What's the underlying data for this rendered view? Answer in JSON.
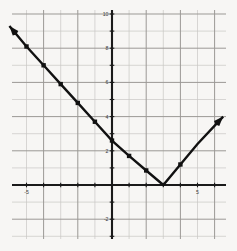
{
  "chart_data": {
    "type": "line",
    "title": "",
    "xlabel": "",
    "ylabel": "",
    "xlim": [
      -6.5,
      6.8
    ],
    "ylim": [
      -4.2,
      10.5
    ],
    "grid": true,
    "minor_grid_step": 1,
    "major_grid_step": 2,
    "legend": "none",
    "axis_color": "#1a1a1a",
    "grid_color_minor": "#c9c7c4",
    "grid_color_major": "#9a9894",
    "curve_color": "#111111",
    "background_color": "#f7f6f4",
    "x_tick_labels": [
      {
        "value": -5,
        "text": "-5"
      },
      {
        "value": 5,
        "text": "5"
      }
    ],
    "y_tick_labels": [
      {
        "value": 10,
        "text": "10"
      },
      {
        "value": 8,
        "text": "8"
      },
      {
        "value": 6,
        "text": "6"
      },
      {
        "value": 4,
        "text": "4"
      },
      {
        "value": 2,
        "text": "2"
      },
      {
        "value": -2,
        "text": "-2"
      }
    ],
    "series": [
      {
        "name": "absolute-value-function",
        "shape": "V",
        "vertex": [
          3,
          0
        ],
        "left_slope": -1.5,
        "right_slope": 1.15,
        "arrow_start": true,
        "arrow_end": true,
        "points": [
          [
            -6.0,
            9.3
          ],
          [
            -5.0,
            8.1
          ],
          [
            -4.0,
            7.0
          ],
          [
            -3.0,
            5.9
          ],
          [
            -2.0,
            4.8
          ],
          [
            -1.0,
            3.7
          ],
          [
            0.0,
            2.6
          ],
          [
            1.0,
            1.7
          ],
          [
            2.0,
            0.85
          ],
          [
            3.0,
            0.0
          ],
          [
            4.0,
            1.2
          ],
          [
            5.0,
            2.4
          ],
          [
            6.5,
            4.0
          ]
        ],
        "markers": [
          [
            -5.0,
            8.1
          ],
          [
            -4.0,
            7.0
          ],
          [
            -3.0,
            5.9
          ],
          [
            -2.0,
            4.8
          ],
          [
            -1.0,
            3.7
          ],
          [
            0.0,
            2.6
          ],
          [
            1.0,
            1.7
          ],
          [
            2.0,
            0.85
          ],
          [
            4.0,
            1.2
          ]
        ]
      }
    ]
  },
  "graph": {
    "caption": "",
    "alt_text": "Coordinate plane graph of a V shaped absolute value function with vertex on the x axis"
  }
}
